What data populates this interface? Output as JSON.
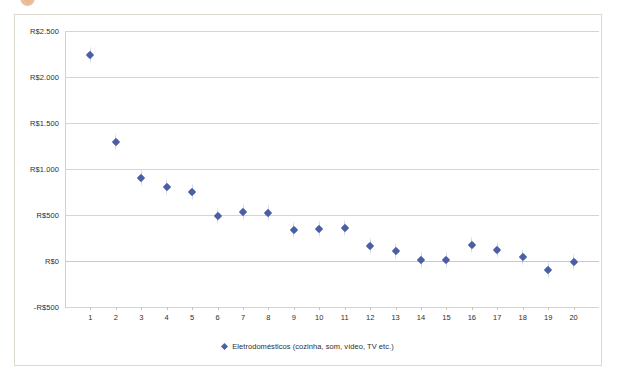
{
  "chart_data": {
    "type": "scatter",
    "title": "",
    "xlabel": "",
    "ylabel": "",
    "categories": [
      1,
      2,
      3,
      4,
      5,
      6,
      7,
      8,
      9,
      10,
      11,
      12,
      13,
      14,
      15,
      16,
      17,
      18,
      19,
      20
    ],
    "x_tick_labels": [
      "1",
      "2",
      "3",
      "4",
      "5",
      "6",
      "7",
      "8",
      "9",
      "10",
      "11",
      "12",
      "13",
      "14",
      "15",
      "16",
      "17",
      "18",
      "19",
      "20"
    ],
    "y_tick_labels": [
      "R$2.500",
      "R$2.000",
      "R$1.500",
      "R$1.000",
      "R$500",
      "R$0",
      "-R$500"
    ],
    "y_tick_values": [
      2500,
      2000,
      1500,
      1000,
      500,
      0,
      -500
    ],
    "ylim": [
      -500,
      2500
    ],
    "xlim": [
      0,
      21
    ],
    "grid": true,
    "legend_position": "bottom",
    "series": [
      {
        "name": "Eletrodomésticos (cozinha, som, vídeo, TV etc.)",
        "color": "#4a5fa5",
        "marker": "diamond",
        "values": [
          2240,
          1290,
          900,
          800,
          750,
          485,
          530,
          520,
          340,
          350,
          355,
          160,
          105,
          10,
          10,
          175,
          120,
          40,
          -95,
          -15
        ]
      }
    ]
  },
  "legend": {
    "marker_icon": "diamond-marker-icon",
    "label": "Eletrodomésticos (cozinha, som, vídeo, TV etc.)"
  },
  "colors": {
    "series": "#4a5fa5",
    "gridline": "#d9d4c6",
    "frame": "#dcd8cf",
    "text": "#2e2e2e"
  }
}
